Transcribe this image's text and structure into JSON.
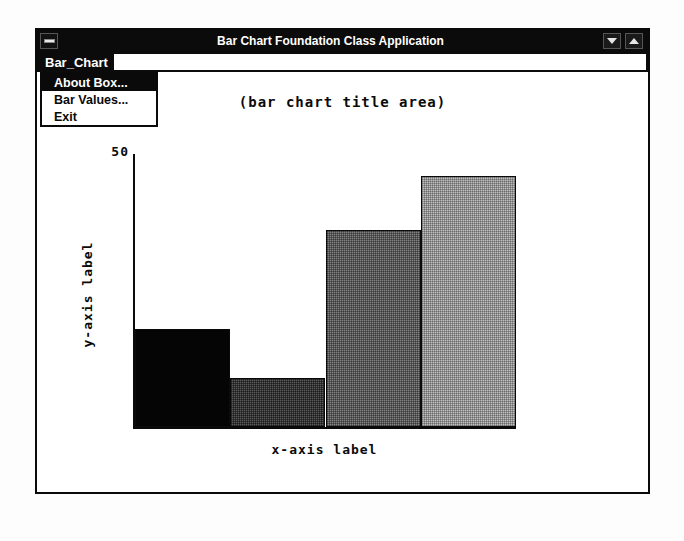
{
  "window": {
    "title": "Bar Chart Foundation Class Application",
    "window_menu_icon": "window-menu-bar-icon",
    "minimize_icon": "triangle-down-icon",
    "maximize_icon": "triangle-up-icon"
  },
  "menubar": {
    "items": [
      {
        "label": "Bar_Chart",
        "active": true
      }
    ]
  },
  "dropdown": {
    "open": true,
    "items": [
      {
        "label": "About Box...",
        "selected": true
      },
      {
        "label": "Bar Values...",
        "selected": false
      },
      {
        "label": "Exit",
        "selected": false
      }
    ]
  },
  "colors": {
    "titlebar_background": "#0b0b0b",
    "titlebar_text": "#ffffff",
    "menu_highlight": "#0a0a0a",
    "client_background": "#ffffff",
    "axis": "#0a0a0a",
    "bar_1": "#050505",
    "bar_2": "#5c5c5c",
    "bar_3": "#848484",
    "bar_4": "#bdbdbd"
  },
  "chart_data": {
    "type": "bar",
    "title": "(bar chart title area)",
    "xlabel": "x-axis label",
    "ylabel": "y-axis label",
    "ylim": [
      0,
      50
    ],
    "ytick_labels": [
      "50"
    ],
    "grid": false,
    "legend": null,
    "categories": [
      "1",
      "2",
      "3",
      "4"
    ],
    "values": [
      18,
      9,
      36,
      46
    ],
    "bars": [
      {
        "category": "1",
        "value": 18,
        "fill": "solid-black",
        "color": "#050505"
      },
      {
        "category": "2",
        "value": 9,
        "fill": "dither-dark",
        "color": "#5c5c5c"
      },
      {
        "category": "3",
        "value": 36,
        "fill": "dither-medium",
        "color": "#848484"
      },
      {
        "category": "4",
        "value": 46,
        "fill": "dither-light",
        "color": "#bdbdbd"
      }
    ]
  }
}
